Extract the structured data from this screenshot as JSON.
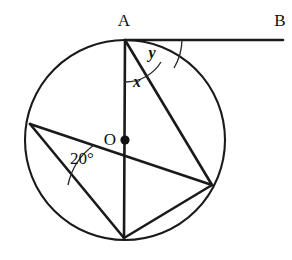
{
  "figure": {
    "type": "circle-geometry-diagram",
    "background_color": "#ffffff",
    "stroke_color": "#1a1a1a"
  },
  "circle": {
    "center_label": "O",
    "center_x": 125,
    "center_y": 140,
    "radius": 100
  },
  "points": [
    {
      "id": "A",
      "label": "A",
      "x": 125,
      "y": 40,
      "label_x": 124,
      "label_y": 26
    },
    {
      "id": "B",
      "label": "B",
      "x": 283,
      "y": 40,
      "label_x": 280,
      "label_y": 26
    },
    {
      "id": "O",
      "label": "O",
      "x": 125,
      "y": 140,
      "label_x": 110,
      "label_y": 140
    },
    {
      "id": "C",
      "label": "",
      "x": 30,
      "y": 124,
      "label_x": 0,
      "label_y": 0
    },
    {
      "id": "D",
      "label": "",
      "x": 212,
      "y": 185,
      "label_x": 0,
      "label_y": 0
    },
    {
      "id": "E",
      "label": "",
      "x": 124,
      "y": 238,
      "label_x": 0,
      "label_y": 0
    }
  ],
  "segments": [
    {
      "name": "tangent-AB",
      "from": "A",
      "to": "B",
      "kind": "tangent"
    },
    {
      "name": "diameter-AE",
      "from": "A",
      "to": "E",
      "kind": "diameter"
    },
    {
      "name": "chord-AD",
      "from": "A",
      "to": "D",
      "kind": "chord"
    },
    {
      "name": "chord-CD",
      "from": "C",
      "to": "D",
      "kind": "chord"
    },
    {
      "name": "chord-CE",
      "from": "C",
      "to": "E",
      "kind": "chord"
    },
    {
      "name": "chord-DE",
      "from": "D",
      "to": "E",
      "kind": "chord"
    }
  ],
  "angles": [
    {
      "id": "x",
      "label": "x",
      "vertex": "A",
      "between": [
        "diameter-AE",
        "chord-AD"
      ],
      "label_x": 137,
      "label_y": 87,
      "arc_radius": 42,
      "unknown": true
    },
    {
      "id": "y",
      "label": "y",
      "vertex": "A",
      "between": [
        "chord-AD",
        "tangent-AB"
      ],
      "label_x": 152,
      "label_y": 58,
      "arc_radius": 57,
      "unknown": true
    },
    {
      "id": "twenty",
      "label": "20°",
      "vertex": "C",
      "between": [
        "chord-CD",
        "chord-CE"
      ],
      "label_x": 82,
      "label_y": 164,
      "arc_radius": 66,
      "unknown": false
    }
  ],
  "labels": {
    "point_a": "A",
    "point_b": "B",
    "center_o": "O",
    "angle_x": "x",
    "angle_y": "y",
    "angle_twenty": "20°"
  }
}
